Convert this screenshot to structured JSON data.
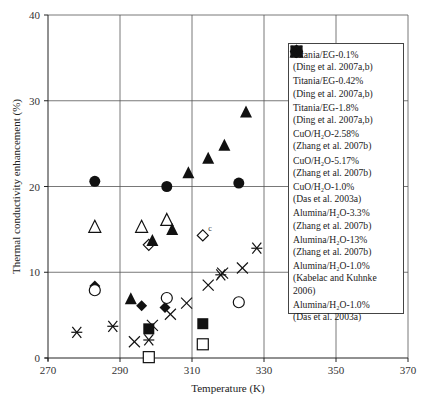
{
  "chart_data": {
    "type": "scatter",
    "title": "",
    "xlabel": "Temperature (K)",
    "ylabel": "Thermal conductivity enhancement (%)",
    "xlim": [
      270,
      370
    ],
    "ylim": [
      0,
      40
    ],
    "xticks": [
      270,
      290,
      310,
      330,
      350,
      370
    ],
    "yticks": [
      0,
      10,
      20,
      30,
      40
    ],
    "grid": true,
    "legend_position": "right-inside",
    "annotations": [
      {
        "text": "c",
        "x": 314.5,
        "y": 14.8
      }
    ],
    "series": [
      {
        "name": "Titania/EG-0.1%",
        "source": "(Ding et al. 2007a,b)",
        "marker": "square-open",
        "points": [
          [
            298,
            0.1
          ],
          [
            313,
            1.6
          ]
        ]
      },
      {
        "name": "Titania/EG-0.42%",
        "source": "(Ding et al. 2007a,b)",
        "marker": "square-filled",
        "points": [
          [
            298,
            3.4
          ],
          [
            313,
            4.0
          ]
        ]
      },
      {
        "name": "Titania/EG-1.8%",
        "source": "(Ding et al. 2007a,b)",
        "marker": "diamond-open",
        "points": [
          [
            298,
            13.2
          ],
          [
            313,
            14.3
          ]
        ]
      },
      {
        "name": "CuO/H2O-2.58%",
        "source": "(Zhang et al. 2007b)",
        "marker": "diamond-filled",
        "points": [
          [
            283,
            8.4
          ],
          [
            296,
            6.1
          ],
          [
            302.5,
            5.9
          ]
        ]
      },
      {
        "name": "CuO/H2O-5.17%",
        "source": "(Zhang et al. 2007b)",
        "marker": "triangle-open",
        "points": [
          [
            283,
            15.3
          ],
          [
            296,
            15.3
          ],
          [
            303,
            16.1
          ]
        ]
      },
      {
        "name": "CuO/H2O-1.0%",
        "source": "(Das et al. 2003a)",
        "marker": "triangle-filled",
        "points": [
          [
            293,
            6.9
          ],
          [
            299,
            13.7
          ],
          [
            304.5,
            15.0
          ],
          [
            309,
            21.6
          ],
          [
            314.5,
            23.3
          ],
          [
            319,
            24.8
          ],
          [
            325,
            28.7
          ]
        ]
      },
      {
        "name": "Alumina/H2O-3.3%",
        "source": "(Zhang et al. 2007b)",
        "marker": "circle-open",
        "points": [
          [
            283,
            7.9
          ],
          [
            303,
            7.0
          ],
          [
            323,
            6.5
          ]
        ]
      },
      {
        "name": "Alumina/H2O-13%",
        "source": "(Zhang et al. 2007b)",
        "marker": "circle-filled",
        "points": [
          [
            283,
            20.6
          ],
          [
            303,
            20.0
          ],
          [
            323,
            20.4
          ]
        ]
      },
      {
        "name": "Alumina/H2O-1.0%",
        "source": "(Kabelac and Kuhnke 2006)",
        "marker": "asterisk",
        "points": [
          [
            278,
            3.0
          ],
          [
            288,
            3.7
          ],
          [
            298,
            2.1
          ],
          [
            318,
            9.7
          ],
          [
            328,
            12.8
          ]
        ]
      },
      {
        "name": "Alumina/H2O-1.0%",
        "source": "(Das et al. 2003a)",
        "marker": "cross",
        "points": [
          [
            294,
            1.9
          ],
          [
            299,
            3.8
          ],
          [
            304,
            5.1
          ],
          [
            308.5,
            6.4
          ],
          [
            314.5,
            8.5
          ],
          [
            318.5,
            9.9
          ],
          [
            324,
            10.5
          ]
        ]
      }
    ]
  },
  "legend": {
    "items": [
      {
        "line1": "Titania/EG-0.1%",
        "line2": "(Ding et al. 2007a,b)"
      },
      {
        "line1": "Titania/EG-0.42%",
        "line2": "(Ding et al. 2007a,b)"
      },
      {
        "line1": "Titania/EG-1.8%",
        "line2": "(Ding et al. 2007a,b)"
      },
      {
        "line1": "CuO/H₂O-2.58%",
        "line2": "(Zhang et al. 2007b)"
      },
      {
        "line1": "CuO/H₂O-5.17%",
        "line2": "(Zhang et al. 2007b)"
      },
      {
        "line1": "CuO/H₂O-1.0%",
        "line2": "(Das et al. 2003a)"
      },
      {
        "line1": "Alumina/H₂O-3.3%",
        "line2": "(Zhang et al. 2007b)"
      },
      {
        "line1": "Alumina/H₂O-13%",
        "line2": "(Zhang et al. 2007b)"
      },
      {
        "line1": "Alumina/H₂O-1.0%",
        "line2": "(Kabelac and Kuhnke",
        "line3": "2006)"
      },
      {
        "line1": "Alumina/H₂O-1.0%",
        "line2": "(Das et al. 2003a)"
      }
    ]
  }
}
